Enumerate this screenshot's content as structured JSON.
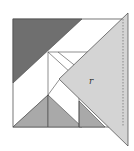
{
  "figure": {
    "label": "r",
    "colors": {
      "dark_piece": "#6f6f6f",
      "medium_piece": "#a9a9a9",
      "light_piece": "#d4d4d4",
      "outline": "#333333",
      "background": "#ffffff"
    }
  }
}
